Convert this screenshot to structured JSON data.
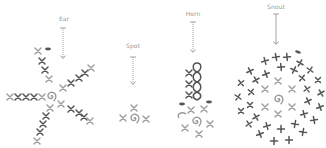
{
  "colors": {
    "dark_stitch": "#555555",
    "light_stitch": "#9a9a9a",
    "arrow": "#9a9a9a",
    "label": "#9a9a9a",
    "background": "#ffffff"
  },
  "legend_symbols": {
    "x": "single crochet (sc)",
    "plus": "single crochet (sc)",
    "spiral": "magic ring",
    "oval": "chain / slip stitch marker",
    "zero": "loop stitch"
  },
  "diagrams": [
    {
      "id": "ear",
      "label": "Ear",
      "label_x": 64,
      "label_y": 15,
      "arrow": {
        "x": 63,
        "y1": 28,
        "y2": 59
      }
    },
    {
      "id": "spot",
      "label": "Spot",
      "label_x": 133,
      "label_y": 42,
      "arrow": {
        "x": 133,
        "y1": 57,
        "y2": 85
      }
    },
    {
      "id": "horn",
      "label": "Horn",
      "label_x": 193,
      "label_y": 10,
      "arrow": {
        "x": 193,
        "y1": 22,
        "y2": 53
      }
    },
    {
      "id": "snout",
      "label": "Snout",
      "label_x": 276,
      "label_y": 3,
      "arrow": {
        "x": 276,
        "y1": 14,
        "y2": 45
      }
    }
  ]
}
